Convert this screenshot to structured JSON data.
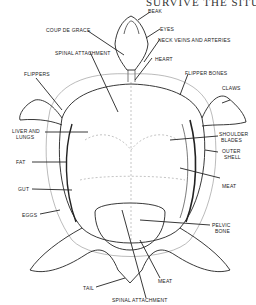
{
  "header": "SURVIVE THE SITUATION",
  "labels": {
    "beak": "Beak",
    "coup_de_grace": "Coup de grace",
    "eyes": "Eyes",
    "neck_veins": "Neck veins and arteries",
    "spinal_attachment_top": "Spinal attachment",
    "heart": "Heart",
    "flippers": "Flippers",
    "flipper_bones": "Flipper bones",
    "claws": "Claws",
    "liver_lungs_1": "Liver and",
    "liver_lungs_2": "lungs",
    "shoulder_blades_1": "Shoulder",
    "shoulder_blades_2": "blades",
    "outer_shell_1": "Outer",
    "outer_shell_2": "shell",
    "fat": "Fat",
    "meat_right": "Meat",
    "gut": "Gut",
    "eggs": "Eggs",
    "pelvic_bone_1": "Pelvic",
    "pelvic_bone_2": "bone",
    "tail": "Tail",
    "meat_bottom": "Meat",
    "spinal_attachment_bottom": "Spinal attachment"
  }
}
